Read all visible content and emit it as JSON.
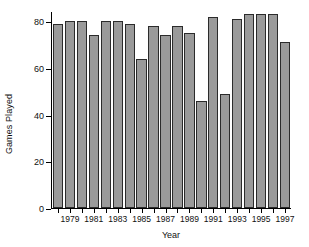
{
  "chart_data": {
    "type": "bar",
    "title": "",
    "xlabel": "Year",
    "ylabel": "Games Played",
    "categories": [
      1978,
      1979,
      1980,
      1981,
      1982,
      1983,
      1984,
      1985,
      1986,
      1987,
      1988,
      1989,
      1990,
      1991,
      1992,
      1993,
      1994,
      1995,
      1996,
      1997
    ],
    "values": [
      79,
      80,
      80,
      74,
      80,
      80,
      79,
      64,
      78,
      74,
      78,
      75,
      46,
      82,
      49,
      81,
      83,
      83,
      83,
      71
    ],
    "ylim": [
      0,
      84
    ],
    "xlim": [
      1977.5,
      1997.5
    ],
    "yticks": [
      0,
      20,
      40,
      60,
      80
    ],
    "ytick_labels": [
      "0",
      "20",
      "40",
      "60",
      "80"
    ],
    "xticks": [
      1979,
      1981,
      1983,
      1985,
      1987,
      1989,
      1991,
      1993,
      1995,
      1997
    ],
    "xtick_labels": [
      "1979",
      "1981",
      "1983",
      "1985",
      "1987",
      "1989",
      "1991",
      "1993",
      "1995",
      "1997"
    ],
    "grid": false,
    "legend": null,
    "bar_fill_color": "#9a9a9a",
    "bar_edge_color": "#2b2b2b",
    "axis_color": "#000000",
    "background_color": "#ffffff"
  }
}
